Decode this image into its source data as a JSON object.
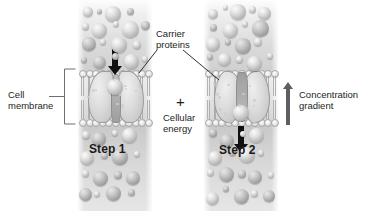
{
  "figure": {
    "background_color": "#ffffff",
    "ink_color": "#231f20"
  },
  "annotations": {
    "cell_membrane": {
      "line1": "Cell",
      "line2": "membrane"
    },
    "carrier_proteins": {
      "line1": "Carrier",
      "line2": "proteins"
    },
    "cellular_energy": {
      "plus": "+",
      "line1": "Cellular",
      "line2": "energy"
    },
    "concentration_gradient": {
      "line1": "Concentration",
      "line2": "gradient",
      "arrow": "up-arrow-icon",
      "arrow_color": "#5f5f5f"
    }
  },
  "panels": [
    {
      "id": "step-1",
      "step_label": "Step 1",
      "transport_arrow": "down-arrow-icon",
      "arrow_color": "#101010",
      "description": "Molecule binds to carrier proteins at the outer face of the membrane"
    },
    {
      "id": "step-2",
      "step_label": "Step 2",
      "transport_arrow": "down-arrow-icon",
      "arrow_color": "#101010",
      "description": "Carrier proteins change shape and release the molecule inside the cell"
    }
  ]
}
